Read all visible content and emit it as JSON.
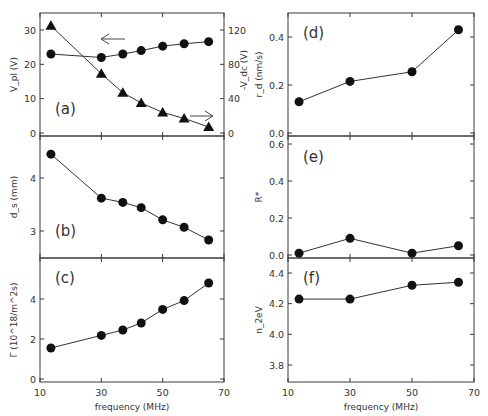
{
  "figure": {
    "xlabel": "frequency (MHz)",
    "x_ticks": [
      "10",
      "30",
      "50",
      "70"
    ]
  },
  "chart_data": [
    {
      "id": "a",
      "type": "line",
      "panel_label": "(a)",
      "xlabel": "",
      "ylabel": "V_pl (V)",
      "ylabel_right": "-V_dc (V)",
      "xlim": [
        10,
        70
      ],
      "ylim": [
        0,
        35
      ],
      "ylim_right": [
        0,
        140
      ],
      "y_ticks": [
        "0",
        "10",
        "20",
        "30"
      ],
      "y_ticks_right": [
        "0",
        "40",
        "80",
        "120"
      ],
      "x": [
        13.56,
        30,
        37,
        43,
        50,
        57,
        65
      ],
      "series": [
        {
          "name": "V_pl (left axis, circles)",
          "marker": "circle",
          "axis": "left",
          "values": [
            23,
            22,
            23,
            24,
            25.3,
            26,
            26.6
          ]
        },
        {
          "name": "-V_dc (right axis, triangles)",
          "marker": "triangle",
          "axis": "right",
          "values": [
            125,
            69,
            47,
            35,
            24,
            17,
            7
          ]
        }
      ],
      "annotations": [
        "left arrow pointing to circle series (left axis)",
        "right arrow pointing to triangle series (right axis)"
      ]
    },
    {
      "id": "b",
      "type": "line",
      "panel_label": "(b)",
      "ylabel": "d_s (mm)",
      "xlim": [
        10,
        70
      ],
      "ylim": [
        2.45,
        4.75
      ],
      "y_ticks": [
        "3",
        "4"
      ],
      "x": [
        13.56,
        30,
        37,
        43,
        50,
        57,
        65
      ],
      "series": [
        {
          "name": "d_s",
          "marker": "circle",
          "values": [
            4.45,
            3.62,
            3.54,
            3.44,
            3.21,
            3.07,
            2.83
          ]
        }
      ]
    },
    {
      "id": "c",
      "type": "line",
      "panel_label": "(c)",
      "xlabel": "frequency (MHz)",
      "ylabel": "Γ (10^18/m^2s)",
      "xlim": [
        10,
        70
      ],
      "ylim": [
        0,
        6
      ],
      "y_ticks": [
        "0",
        "2",
        "4"
      ],
      "x": [
        13.56,
        30,
        37,
        43,
        50,
        57,
        65
      ],
      "series": [
        {
          "name": "Γ",
          "marker": "circle",
          "values": [
            1.55,
            2.18,
            2.45,
            2.8,
            3.48,
            3.92,
            4.8
          ]
        }
      ]
    },
    {
      "id": "d",
      "type": "line",
      "panel_label": "(d)",
      "ylabel": "r_d (nm/s)",
      "xlim": [
        10,
        70
      ],
      "ylim": [
        0,
        0.5
      ],
      "y_ticks": [
        "0.0",
        "0.2",
        "0.4"
      ],
      "x": [
        13.56,
        30,
        50,
        65
      ],
      "series": [
        {
          "name": "r_d",
          "marker": "circle",
          "values": [
            0.13,
            0.215,
            0.255,
            0.43
          ]
        }
      ]
    },
    {
      "id": "e",
      "type": "line",
      "panel_label": "(e)",
      "ylabel": "R*",
      "xlim": [
        10,
        70
      ],
      "ylim": [
        0,
        0.66
      ],
      "y_ticks": [
        "0.0",
        "0.2",
        "0.4",
        "0.6"
      ],
      "x": [
        13.56,
        30,
        50,
        65
      ],
      "series": [
        {
          "name": "R*",
          "marker": "circle",
          "values": [
            0.01,
            0.09,
            0.01,
            0.05
          ]
        }
      ]
    },
    {
      "id": "f",
      "type": "line",
      "panel_label": "(f)",
      "xlabel": "frequency (MHz)",
      "ylabel": "n_2eV",
      "xlim": [
        10,
        70
      ],
      "ylim": [
        3.7,
        4.5
      ],
      "y_ticks": [
        "3.8",
        "4.0",
        "4.2",
        "4.4"
      ],
      "x": [
        13.56,
        30,
        50,
        65
      ],
      "series": [
        {
          "name": "n_2eV",
          "marker": "circle",
          "values": [
            4.23,
            4.23,
            4.32,
            4.34
          ]
        }
      ]
    }
  ]
}
